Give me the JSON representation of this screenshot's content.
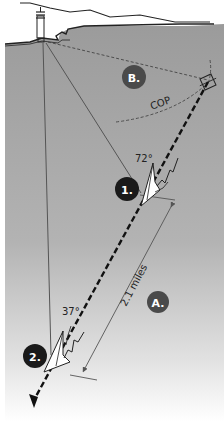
{
  "diagram": {
    "type": "doubling-the-angle-on-the-bow",
    "labels": {
      "section_a": "A.",
      "section_b": "B.",
      "position_1": "1.",
      "position_2": "2.",
      "angle_1": "72°",
      "angle_2": "37°",
      "distance": "2.1 miles",
      "cop": "COP"
    },
    "colors": {
      "water_top": "#9a9a9a",
      "water_bottom": "#ffffff",
      "land": "#ffffff",
      "badge_dark": "#1a1a1a",
      "badge_mid": "#4a4a4a",
      "line": "#555555",
      "course": "#111111"
    }
  }
}
